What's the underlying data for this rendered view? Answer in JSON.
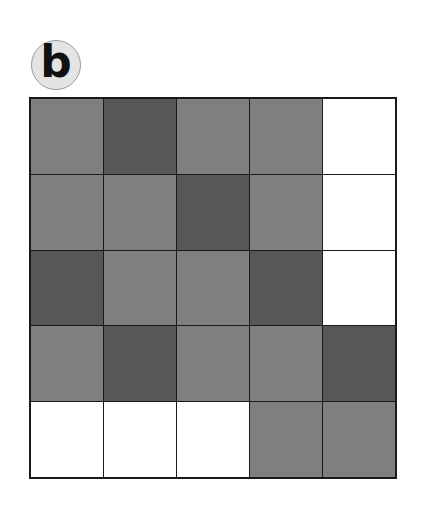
{
  "figure": {
    "label": "b",
    "grid": {
      "rows": 5,
      "cols": 5,
      "legend": {
        "M": "medium gray",
        "D": "dark gray",
        "W": "white"
      },
      "colors": {
        "M": "#7f7f7f",
        "D": "#575757",
        "W": "#ffffff"
      },
      "cells": [
        [
          "M",
          "D",
          "M",
          "M",
          "W"
        ],
        [
          "M",
          "M",
          "D",
          "M",
          "W"
        ],
        [
          "D",
          "M",
          "M",
          "D",
          "W"
        ],
        [
          "M",
          "D",
          "M",
          "M",
          "D"
        ],
        [
          "W",
          "W",
          "W",
          "M",
          "M"
        ]
      ]
    }
  }
}
